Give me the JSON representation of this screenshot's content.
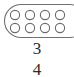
{
  "figure": {
    "name": "fraction-model-diagram",
    "background_color": "#ffffff",
    "stroke_color": "#6e6e6e",
    "text_color": "#2b2b2b"
  },
  "group_shape": {
    "type": "stadium",
    "label": "group-outline",
    "stroke_color": "#707070",
    "fill": "none"
  },
  "counters": {
    "total": 8,
    "rows": 2,
    "columns": 4,
    "shape": "circle",
    "fill": "none",
    "stroke_color": "#6a6a6a",
    "row_1": [
      "circle",
      "circle",
      "circle",
      "circle"
    ],
    "row_2": [
      "circle",
      "circle",
      "circle",
      "circle"
    ]
  },
  "fraction": {
    "numerator": "3",
    "denominator": "4",
    "bar": "fraction-bar",
    "value_text": "3/4"
  }
}
